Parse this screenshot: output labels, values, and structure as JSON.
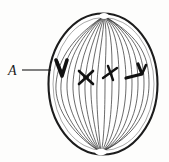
{
  "figure": {
    "title": "Cell in mitosis with spindle and chromosomes",
    "background_color": "#fdfdfc",
    "ink_color": "#1a1a1a",
    "label": {
      "text": "A",
      "points_to": "leftmost-chromosome",
      "x": 11,
      "y": 74,
      "leader_line": {
        "x1": 22,
        "y1": 70,
        "x2": 51,
        "y2": 70
      }
    },
    "cell": {
      "shape": "oval",
      "center_x": 103,
      "center_y": 84,
      "radius_x": 55,
      "radius_y": 71,
      "outline_color": "#1c1c1c",
      "outline_width": 2.1,
      "fill_color": "#ffffff"
    },
    "spindle": {
      "fiber_count": 15,
      "fiber_color": "#3a3a3a",
      "fiber_width": 0.75,
      "top_pole": {
        "x": 104,
        "y": 15
      },
      "bottom_pole": {
        "x": 101,
        "y": 153
      }
    },
    "chromosomes": [
      {
        "id": "chromosome-a",
        "shape": "V",
        "label": "A",
        "x": 61,
        "y": 70,
        "stroke_width": 3.4,
        "highlighted": true
      },
      {
        "id": "chromosome-2",
        "shape": "X",
        "x": 87,
        "y": 78,
        "stroke_width": 2.6,
        "highlighted": false
      },
      {
        "id": "chromosome-3",
        "shape": "X",
        "x": 111,
        "y": 74,
        "stroke_width": 2.4,
        "highlighted": false
      },
      {
        "id": "chromosome-4",
        "shape": "angled-V",
        "x": 137,
        "y": 73,
        "stroke_width": 3.2,
        "highlighted": false
      }
    ]
  }
}
